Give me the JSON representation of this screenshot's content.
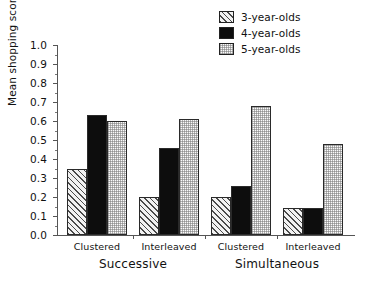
{
  "chart_data": {
    "type": "bar",
    "title": "",
    "xlabel": "",
    "ylabel": "Mean shopping scores",
    "ylim": [
      0.0,
      1.0
    ],
    "ytick_labels": [
      "0.0",
      "0.1",
      "0.2",
      "0.3",
      "0.4",
      "0.5",
      "0.6",
      "0.7",
      "0.8",
      "0.9",
      "1.0"
    ],
    "ytick_values": [
      0.0,
      0.1,
      0.2,
      0.3,
      0.4,
      0.5,
      0.6,
      0.7,
      0.8,
      0.9,
      1.0
    ],
    "grid": false,
    "legend_position": "top-right",
    "categories": [
      "Clustered",
      "Interleaved",
      "Clustered",
      "Interleaved"
    ],
    "supercategories": [
      {
        "label": "Successive",
        "groups": [
          0,
          1
        ]
      },
      {
        "label": "Simultaneous",
        "groups": [
          2,
          3
        ]
      }
    ],
    "series": [
      {
        "name": "3-year-olds",
        "pattern": "diagonal-hatch",
        "color": "#e8e8e8",
        "values": [
          0.35,
          0.2,
          0.2,
          0.14
        ]
      },
      {
        "name": "4-year-olds",
        "pattern": "solid-black",
        "color": "#0d0d0d",
        "values": [
          0.63,
          0.46,
          0.26,
          0.14
        ]
      },
      {
        "name": "5-year-olds",
        "pattern": "light-stipple",
        "color": "#fbfbfb",
        "values": [
          0.6,
          0.61,
          0.68,
          0.48
        ]
      }
    ]
  },
  "legend": {
    "items": [
      {
        "label": "3-year-olds"
      },
      {
        "label": "4-year-olds"
      },
      {
        "label": "5-year-olds"
      }
    ]
  },
  "axes": {
    "y_title": "Mean shopping scores"
  }
}
